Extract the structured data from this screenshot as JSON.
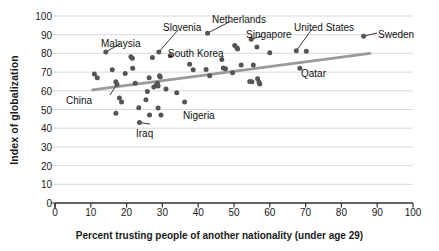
{
  "chart_data": {
    "type": "scatter",
    "title": "",
    "xlabel": "Percent trusting people of another nationality (under age 29)",
    "ylabel": "Index of globalization",
    "xlim": [
      0,
      100
    ],
    "ylim": [
      0,
      100
    ],
    "xticks": [
      0,
      10,
      20,
      30,
      40,
      50,
      60,
      70,
      80,
      90,
      100
    ],
    "yticks": [
      0,
      10,
      20,
      30,
      40,
      50,
      60,
      70,
      80,
      90,
      100
    ],
    "grid": "horizontal",
    "legend": "none",
    "point_color": "#555555",
    "trendline_color": "#9a9a9a",
    "grid_color": "#d9d9d9",
    "axis_color": "#333333",
    "trendline": {
      "x": [
        10.5,
        88.0
      ],
      "y": [
        60.5,
        80.0
      ]
    },
    "points": [
      {
        "x": 11.0,
        "y": 69.0
      },
      {
        "x": 11.8,
        "y": 67.0
      },
      {
        "x": 14.2,
        "y": 80.8,
        "label": "Malaysia"
      },
      {
        "x": 16.0,
        "y": 71.2
      },
      {
        "x": 17.0,
        "y": 64.8
      },
      {
        "x": 17.3,
        "y": 63.5,
        "label": "China"
      },
      {
        "x": 17.0,
        "y": 48.0
      },
      {
        "x": 18.0,
        "y": 56.2
      },
      {
        "x": 18.6,
        "y": 54.0
      },
      {
        "x": 19.6,
        "y": 69.2
      },
      {
        "x": 21.2,
        "y": 78.2
      },
      {
        "x": 21.6,
        "y": 77.4
      },
      {
        "x": 21.7,
        "y": 72.0
      },
      {
        "x": 22.4,
        "y": 64.0
      },
      {
        "x": 23.4,
        "y": 51.0
      },
      {
        "x": 23.6,
        "y": 43.0,
        "label": "Iraq"
      },
      {
        "x": 25.4,
        "y": 55.2
      },
      {
        "x": 25.8,
        "y": 59.6
      },
      {
        "x": 26.3,
        "y": 67.0
      },
      {
        "x": 26.4,
        "y": 47.0
      },
      {
        "x": 27.2,
        "y": 77.8
      },
      {
        "x": 27.6,
        "y": 62.0
      },
      {
        "x": 28.4,
        "y": 63.4
      },
      {
        "x": 28.6,
        "y": 64.0
      },
      {
        "x": 28.8,
        "y": 62.6
      },
      {
        "x": 28.8,
        "y": 50.8
      },
      {
        "x": 29.0,
        "y": 80.8,
        "label": "Slovenia"
      },
      {
        "x": 29.2,
        "y": 68.0
      },
      {
        "x": 29.4,
        "y": 67.4
      },
      {
        "x": 29.6,
        "y": 47.0
      },
      {
        "x": 31.0,
        "y": 61.0
      },
      {
        "x": 32.2,
        "y": 78.8
      },
      {
        "x": 34.0,
        "y": 59.0
      },
      {
        "x": 36.2,
        "y": 54.0
      },
      {
        "x": 37.6,
        "y": 74.2
      },
      {
        "x": 38.6,
        "y": 71.2
      },
      {
        "x": 42.2,
        "y": 71.4
      },
      {
        "x": 42.6,
        "y": 90.8,
        "label": "Netherlands"
      },
      {
        "x": 43.2,
        "y": 68.0
      },
      {
        "x": 46.6,
        "y": 76.8
      },
      {
        "x": 47.0,
        "y": 72.2
      },
      {
        "x": 47.6,
        "y": 71.8
      },
      {
        "x": 49.6,
        "y": 69.6
      },
      {
        "x": 50.2,
        "y": 84.2
      },
      {
        "x": 50.8,
        "y": 83.0,
        "label": "South Korea"
      },
      {
        "x": 51.0,
        "y": 82.4
      },
      {
        "x": 52.0,
        "y": 73.8
      },
      {
        "x": 54.4,
        "y": 65.0
      },
      {
        "x": 54.8,
        "y": 87.6,
        "label": "Singapore"
      },
      {
        "x": 55.0,
        "y": 64.8
      },
      {
        "x": 55.4,
        "y": 73.8
      },
      {
        "x": 56.4,
        "y": 83.4
      },
      {
        "x": 56.6,
        "y": 66.4
      },
      {
        "x": 57.0,
        "y": 64.6
      },
      {
        "x": 57.2,
        "y": 63.6
      },
      {
        "x": 60.0,
        "y": 80.4
      },
      {
        "x": 67.4,
        "y": 81.4,
        "label": "United States"
      },
      {
        "x": 68.4,
        "y": 72.0,
        "label": "Qatar"
      },
      {
        "x": 70.2,
        "y": 81.2
      },
      {
        "x": 86.2,
        "y": 89.2,
        "label": "Sweden"
      }
    ],
    "annotations": [
      {
        "text": "Malaysia",
        "x": 101,
        "y": 38
      },
      {
        "text": "Slovenia",
        "x": 163,
        "y": 22
      },
      {
        "text": "Netherlands",
        "x": 212,
        "y": 14
      },
      {
        "text": "Singapore",
        "x": 246,
        "y": 29
      },
      {
        "text": "United States",
        "x": 294,
        "y": 22
      },
      {
        "text": "Sweden",
        "x": 378,
        "y": 29
      },
      {
        "text": "South Korea",
        "x": 168,
        "y": 48
      },
      {
        "text": "China",
        "x": 66,
        "y": 95
      },
      {
        "text": "Nigeria",
        "x": 183,
        "y": 110
      },
      {
        "text": "Iraq",
        "x": 136,
        "y": 128
      },
      {
        "text": "Qatar",
        "x": 301,
        "y": 68
      }
    ]
  }
}
